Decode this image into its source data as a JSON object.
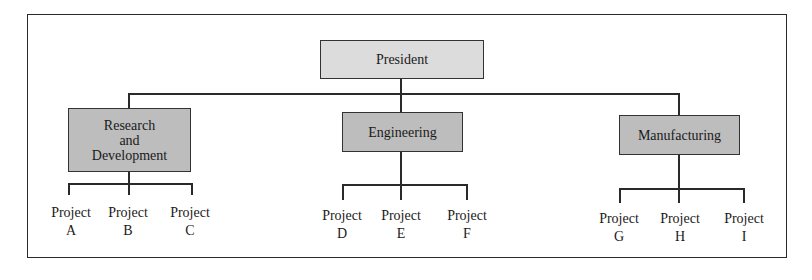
{
  "diagram": {
    "type": "organization-chart",
    "root": {
      "label": "President"
    },
    "departments": [
      {
        "label": "Research and Development",
        "lines": [
          "Research",
          "and",
          "Development"
        ],
        "projects": [
          {
            "word": "Project",
            "letter": "A"
          },
          {
            "word": "Project",
            "letter": "B"
          },
          {
            "word": "Project",
            "letter": "C"
          }
        ]
      },
      {
        "label": "Engineering",
        "lines": [
          "Engineering"
        ],
        "projects": [
          {
            "word": "Project",
            "letter": "D"
          },
          {
            "word": "Project",
            "letter": "E"
          },
          {
            "word": "Project",
            "letter": "F"
          }
        ]
      },
      {
        "label": "Manufacturing",
        "lines": [
          "Manufacturing"
        ],
        "projects": [
          {
            "word": "Project",
            "letter": "G"
          },
          {
            "word": "Project",
            "letter": "H"
          },
          {
            "word": "Project",
            "letter": "I"
          }
        ]
      }
    ],
    "colors": {
      "president_fill": "#dcdcdc",
      "department_fill": "#bdbdbd",
      "line": "#2a2a2a"
    }
  }
}
